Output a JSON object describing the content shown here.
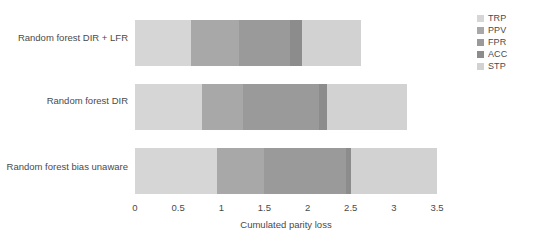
{
  "chart_data": {
    "type": "bar",
    "orientation": "horizontal",
    "stacked": true,
    "title": "",
    "xlabel": "Cumulated parity loss",
    "ylabel": "",
    "xlim": [
      0,
      3.5
    ],
    "xticks": [
      0,
      0.5,
      1,
      1.5,
      2,
      2.5,
      3,
      3.5
    ],
    "xtick_labels": [
      "0",
      "0.5",
      "1",
      "1.5",
      "2",
      "2.5",
      "3",
      "3.5"
    ],
    "grid": false,
    "legend_position": "right",
    "categories": [
      "Random forest DIR + LFR",
      "Random forest DIR",
      "Random forest bias unaware"
    ],
    "series": [
      {
        "name": "TRP",
        "color": "#d6d6d6",
        "values": [
          0.65,
          0.78,
          0.95
        ]
      },
      {
        "name": "PPV",
        "color": "#a8a8a8",
        "values": [
          0.55,
          0.47,
          0.55
        ]
      },
      {
        "name": "FPR",
        "color": "#9a9a9a",
        "values": [
          0.6,
          0.88,
          0.95
        ]
      },
      {
        "name": "ACC",
        "color": "#8c8c8c",
        "values": [
          0.13,
          0.09,
          0.05
        ]
      },
      {
        "name": "STP",
        "color": "#d2d2d2",
        "values": [
          0.69,
          0.93,
          1.0
        ]
      }
    ],
    "cumulative_totals": [
      2.62,
      3.15,
      3.5
    ]
  },
  "legend": {
    "items": [
      {
        "label": "TRP",
        "color": "#d6d6d6"
      },
      {
        "label": "PPV",
        "color": "#a8a8a8"
      },
      {
        "label": "FPR",
        "color": "#9a9a9a"
      },
      {
        "label": "ACC",
        "color": "#8c8c8c"
      },
      {
        "label": "STP",
        "color": "#d2d2d2"
      }
    ]
  }
}
